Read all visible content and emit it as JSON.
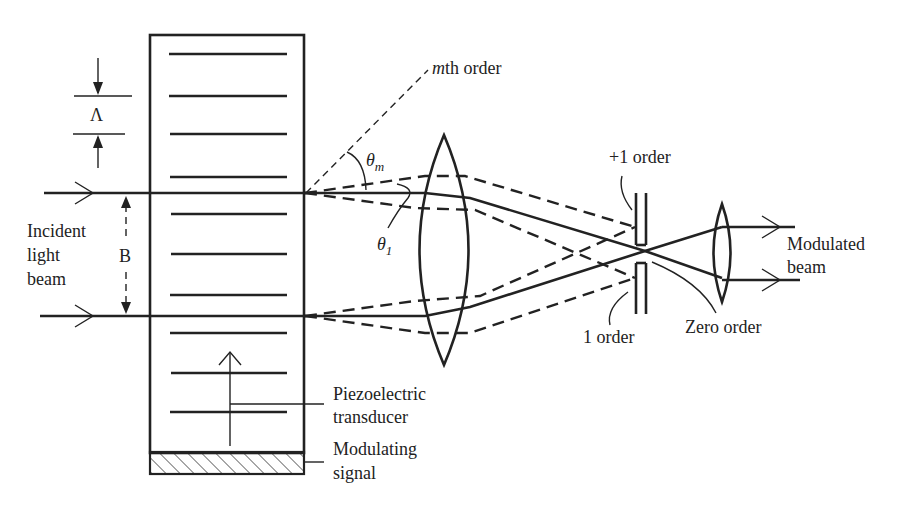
{
  "diagram": {
    "labels": {
      "lambda": "Λ",
      "b": "B",
      "incident_line1": "Incident",
      "incident_line2": "light",
      "incident_line3": "beam",
      "mth_order_m": "m",
      "mth_order_rest": "th order",
      "theta": "θ",
      "theta_m_sub": "m",
      "theta_1_sub": "1",
      "plus1_order": "+1 order",
      "minus1_order": "1 order",
      "zero_order": "Zero order",
      "modulated_line1": "Modulated",
      "modulated_line2": "beam",
      "piezo_line1": "Piezoelectric",
      "piezo_line2": "transducer",
      "modsig_line1": "Modulating",
      "modsig_line2": "signal"
    },
    "components": [
      "acoustic-cell",
      "focusing-lens",
      "spatial-filter-slit",
      "collimating-lens",
      "piezoelectric-transducer"
    ],
    "grating_lines": 10
  }
}
